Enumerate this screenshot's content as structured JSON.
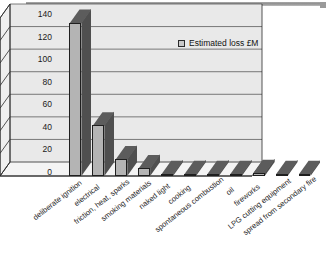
{
  "chart_data": {
    "type": "bar",
    "title": "",
    "subtitle": "",
    "xlabel": "",
    "ylabel": "",
    "ylim": [
      0,
      140
    ],
    "ytick_step": 20,
    "yticks": [
      "0",
      "20",
      "40",
      "60",
      "80",
      "100",
      "120",
      "140"
    ],
    "grid": true,
    "legend_position": "inside-top-right",
    "style": "3d-column",
    "categories": [
      "deliberate ignition",
      "electrical",
      "friction, heat, sparks",
      "smoking materials",
      "naked light",
      "cooking",
      "spontaneous combustion",
      "oil",
      "fireworks",
      "LPG cutting equipment",
      "spread from secondary fire"
    ],
    "series": [
      {
        "name": "Estimated loss £M",
        "values": [
          136,
          45,
          15,
          7,
          2,
          2,
          1,
          1,
          3,
          1,
          1
        ]
      }
    ]
  },
  "legend": {
    "entries": [
      {
        "label": "Estimated loss £M",
        "swatch_color": "#c9c9c9"
      }
    ]
  },
  "colors": {
    "bar_front": "#b4b4b4",
    "bar_side": "#4f4f4f",
    "bar_top": "#5c5c5c",
    "plot_background": "#e9e9e9",
    "plot_floor": "#f2f2f2",
    "gridline": "#5a5a5a",
    "axis_line": "#2a2a2a",
    "text": "#1a1a1a",
    "page_background": "#ffffff"
  }
}
